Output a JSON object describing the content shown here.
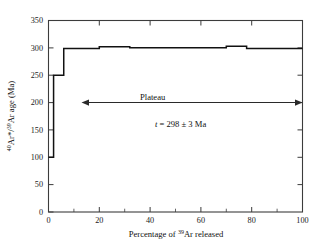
{
  "figure": {
    "background_color": "#ffffff",
    "line_color": "#111111",
    "axis_color": "#3c3c3c"
  },
  "chart_data": {
    "type": "line",
    "subtype": "ar-ar-step-heating-age-spectrum",
    "title": "",
    "xlabel_parts": {
      "prefix": "Percentage of ",
      "superscript": "39",
      "element": "Ar",
      "suffix": " released"
    },
    "xlabel": "Percentage of 39Ar released",
    "ylabel_parts": {
      "superscript1": "40",
      "part1": "Ar*/",
      "superscript2": "39",
      "part2": "Ar age (Ma)"
    },
    "ylabel": "40Ar*/39Ar age (Ma)",
    "xlim": [
      0,
      100
    ],
    "ylim": [
      0,
      350
    ],
    "xticks": [
      0,
      20,
      40,
      60,
      80,
      100
    ],
    "xticklabels": [
      "0",
      "20",
      "40",
      "60",
      "80",
      "100"
    ],
    "xminor_ticks": [
      10,
      30,
      50,
      70,
      90
    ],
    "yticks": [
      0,
      50,
      100,
      150,
      200,
      250,
      300,
      350
    ],
    "yticklabels": [
      "0",
      "50",
      "100",
      "150",
      "200",
      "250",
      "300",
      "350"
    ],
    "grid": false,
    "legend": null,
    "steps": [
      {
        "x_start": 0,
        "x_end": 2,
        "age": 100
      },
      {
        "x_start": 2,
        "x_end": 6,
        "age": 250
      },
      {
        "x_start": 6,
        "x_end": 20,
        "age": 299
      },
      {
        "x_start": 20,
        "x_end": 32,
        "age": 302
      },
      {
        "x_start": 32,
        "x_end": 70,
        "age": 300
      },
      {
        "x_start": 70,
        "x_end": 78,
        "age": 303
      },
      {
        "x_start": 78,
        "x_end": 100,
        "age": 299
      }
    ],
    "annotations": [
      {
        "name": "plateau-label",
        "text": "Plateau",
        "x": 41,
        "y": 205
      },
      {
        "name": "age-result",
        "italic_symbol": "t",
        "text": " = 298 ± 3 Ma",
        "full_text": "t = 298 ± 3 Ma",
        "x": 52,
        "y": 155
      }
    ],
    "plateau_arrow": {
      "name": "plateau-extent-arrow",
      "x_start": 13,
      "x_end": 100,
      "y": 200,
      "double_headed": true
    },
    "plateau_age": 298,
    "plateau_uncertainty": 3,
    "age_units": "Ma"
  }
}
